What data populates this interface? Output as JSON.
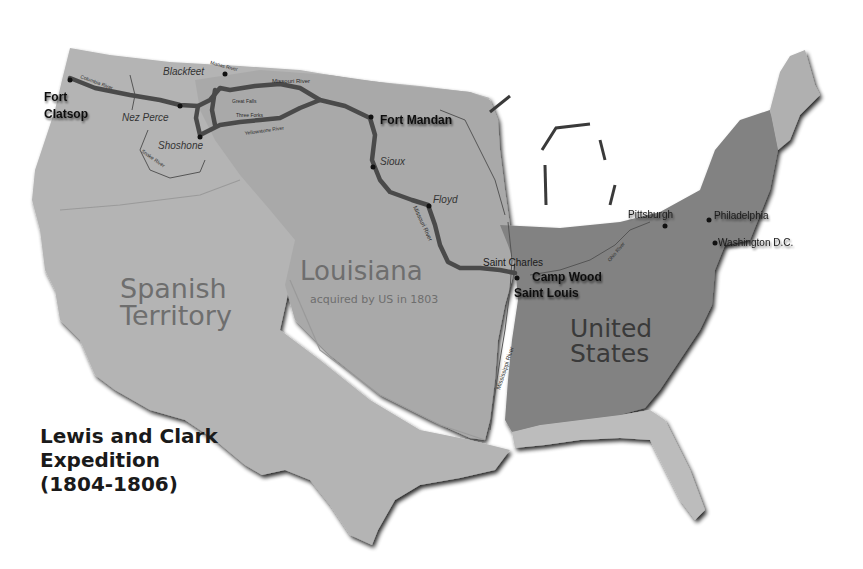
{
  "title": {
    "line1": "Lewis and Clark",
    "line2": "Expedition",
    "line3": "(1804-1806)"
  },
  "regions": {
    "spanish_line1": "Spanish",
    "spanish_line2": "Territory",
    "louisiana": "Louisiana",
    "louisiana_note": "acquired by US in 1803",
    "us_line1": "United",
    "us_line2": "States"
  },
  "forts": {
    "clatsop_line1": "Fort",
    "clatsop_line2": "Clatsop",
    "mandan": "Fort Mandan",
    "camp_wood": "Camp Wood",
    "saint_louis": "Saint Louis"
  },
  "cities": {
    "saint_charles": "Saint Charles",
    "pittsburgh": "Pittsburgh",
    "philadelphia": "Philadelphia",
    "washington": "Washington D.C."
  },
  "tribes": {
    "blackfeet": "Blackfeet",
    "nez_perce": "Nez Perce",
    "shoshone": "Shoshone",
    "sioux": "Sioux",
    "floyd": "Floyd"
  },
  "rivers": {
    "columbia": "Columbia River",
    "marias": "Marias River",
    "missouri_upper": "Missouri River",
    "great_falls": "Great Falls",
    "three_forks": "Three Forks",
    "yellowstone": "Yellowstone River",
    "snake": "Snake River",
    "missouri_lower": "Missouri River",
    "mississippi": "Mississippi River",
    "ohio": "Ohio River"
  },
  "colors": {
    "background": "#ffffff",
    "spanish_territory": "#b4b4b4",
    "louisiana": "#a9a9a9",
    "united_states": "#828282",
    "disputed_light": "#bdbdbd",
    "route": "#4a4a4a",
    "coast_shadow": "#3a3a3a"
  }
}
